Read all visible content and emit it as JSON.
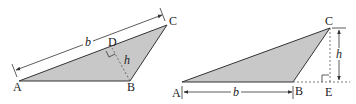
{
  "figure": {
    "colors": {
      "fill": "#c8c8c8",
      "stroke": "#333333",
      "background": "#ffffff"
    },
    "left_triangle": {
      "vertices": {
        "A": "A",
        "B": "B",
        "C": "C",
        "D": "D"
      },
      "base_label": "b",
      "height_label": "h",
      "description": "Triangle ABC with base b measured along AC and height h from B perpendicular to AC at D"
    },
    "right_triangle": {
      "vertices": {
        "A": "A",
        "B": "B",
        "C": "C",
        "E": "E"
      },
      "base_label": "b",
      "height_label": "h",
      "description": "Triangle ABC with base b along AB and height h from C perpendicular to extended AB at E"
    }
  }
}
